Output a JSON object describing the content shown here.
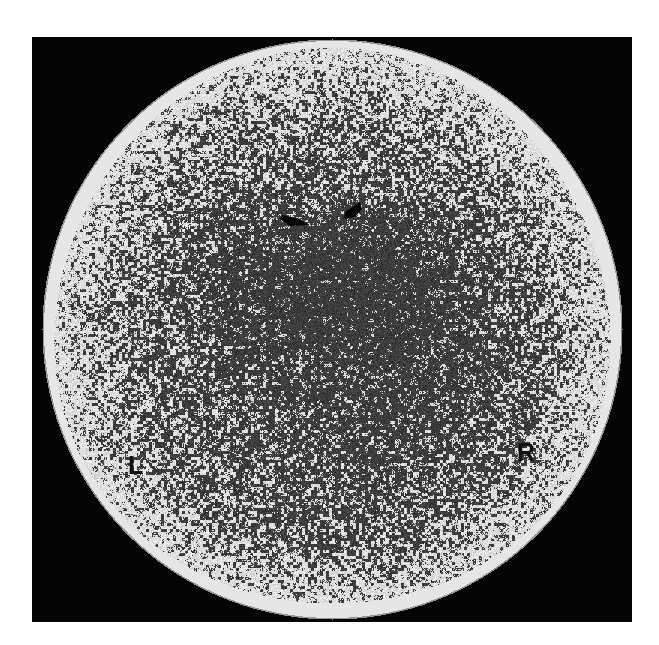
{
  "image": {
    "description": "Circular gamma-camera scintigraphy image on black square background with noisy speckle interior",
    "labels": {
      "left": "L",
      "right": "R"
    },
    "colors": {
      "page_background": "#ffffff",
      "frame_background": "#050505",
      "rim": "#e6e6e6",
      "speckle_dark": "#2a2a2a",
      "speckle_light": "#e8e8e8",
      "label": "#111111"
    }
  }
}
